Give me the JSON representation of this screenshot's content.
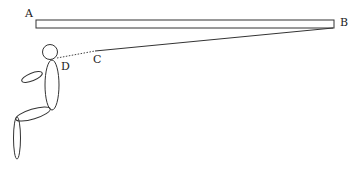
{
  "diagram": {
    "type": "physics-figure",
    "labels": {
      "A": "A",
      "B": "B",
      "C": "C",
      "D": "D"
    },
    "elements": {
      "beam": {
        "description": "horizontal beam / plank from A to B"
      },
      "string": {
        "description": "solid line from C to end B of beam"
      },
      "dotted_line": {
        "description": "dotted line of sight from D (observer eye) to C"
      },
      "person": {
        "description": "seated stick figure observer at D"
      }
    },
    "colors": {
      "stroke": "#333333",
      "background": "#ffffff"
    }
  }
}
